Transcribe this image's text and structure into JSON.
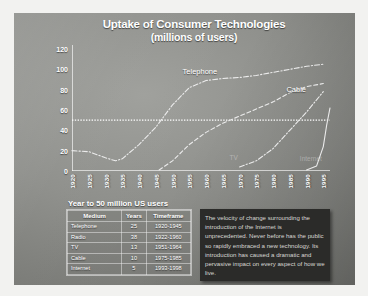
{
  "slide": {
    "title_line1": "Uptake of Consumer Technologies",
    "title_line2": "(millions of users)"
  },
  "chart_data": {
    "type": "line",
    "title": "Uptake of Consumer Technologies (millions of users)",
    "xlabel": "",
    "ylabel": "millions of users",
    "xlim": [
      1920,
      1997
    ],
    "ylim": [
      0,
      120
    ],
    "yticks": [
      0,
      20,
      40,
      60,
      80,
      100,
      120
    ],
    "xticks": [
      1920,
      1925,
      1930,
      1935,
      1940,
      1945,
      1950,
      1955,
      1960,
      1965,
      1970,
      1975,
      1980,
      1985,
      1990,
      1995
    ],
    "grid": false,
    "legend": "inline-labels",
    "annotations": [
      {
        "text": "Telephone",
        "x": 1953,
        "y": 97
      },
      {
        "text": "Cable",
        "x": 1984,
        "y": 80
      },
      {
        "text": "TV",
        "x": 1967,
        "y": 12
      },
      {
        "text": "Internet",
        "x": 1988,
        "y": 11
      }
    ],
    "reference_line": {
      "value": 50,
      "label": "50 million users",
      "style": "dotted"
    },
    "series": [
      {
        "name": "Telephone",
        "style": "dash-dot",
        "x": [
          1920,
          1925,
          1930,
          1933,
          1935,
          1940,
          1945,
          1950,
          1955,
          1960,
          1965,
          1970,
          1975,
          1980,
          1985,
          1990,
          1995
        ],
        "values": [
          20,
          19,
          13,
          10,
          12,
          26,
          43,
          65,
          82,
          89,
          91,
          92,
          94,
          97,
          100,
          103,
          105
        ]
      },
      {
        "name": "TV",
        "style": "dashed",
        "x": [
          1946,
          1950,
          1955,
          1960,
          1965,
          1970,
          1975,
          1980,
          1985,
          1990,
          1995
        ],
        "values": [
          1,
          10,
          26,
          38,
          47,
          54,
          61,
          68,
          77,
          83,
          86
        ]
      },
      {
        "name": "Cable",
        "style": "dash-dot",
        "x": [
          1970,
          1975,
          1980,
          1985,
          1990,
          1995
        ],
        "values": [
          4,
          10,
          22,
          40,
          58,
          78
        ]
      },
      {
        "name": "Internet",
        "style": "solid",
        "x": [
          1990,
          1993,
          1995,
          1996,
          1997
        ],
        "values": [
          1,
          5,
          24,
          45,
          62
        ]
      }
    ]
  },
  "table": {
    "caption": "Year to 50 million US users",
    "columns": [
      "Medium",
      "Years",
      "Timeframe"
    ],
    "rows": [
      {
        "medium": "Telephone",
        "years": "25",
        "timeframe": "1920-1945"
      },
      {
        "medium": "Radio",
        "years": "38",
        "timeframe": "1922-1960"
      },
      {
        "medium": "TV",
        "years": "13",
        "timeframe": "1951-1964"
      },
      {
        "medium": "Cable",
        "years": "10",
        "timeframe": "1975-1985"
      },
      {
        "medium": "Internet",
        "years": "5",
        "timeframe": "1993-1998"
      }
    ]
  },
  "callout": {
    "text": "The velocity of change surrounding the introduction of the Internet is unprecedented.  Never before has the public so rapidly embraced a new technology.  Its introduction has caused a dramatic and pervasive impact on every aspect of how we live."
  },
  "colors": {
    "slide_background": "#8e8f8b",
    "text": "#ffffff",
    "callout_background": "#2b2b29",
    "callout_text": "#d8d8d4",
    "frame": "#f2f2f0"
  }
}
